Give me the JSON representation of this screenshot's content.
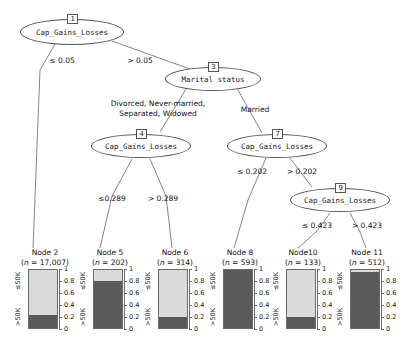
{
  "tree": {
    "title": "Conditional inference decision tree",
    "internal_nodes": [
      {
        "id": "1",
        "label": "Cap_Gains_Losses",
        "cx": 72,
        "cy": 32,
        "rx": 52,
        "ry": 13,
        "box_x": 67,
        "box_y": 14
      },
      {
        "id": "3",
        "label": "Marital status",
        "cx": 213,
        "cy": 79,
        "rx": 48,
        "ry": 12,
        "box_x": 208,
        "box_y": 62
      },
      {
        "id": "4",
        "label": "Cap_Gains_Losses",
        "cx": 141,
        "cy": 146,
        "rx": 50,
        "ry": 12,
        "box_x": 136,
        "box_y": 129
      },
      {
        "id": "7",
        "label": "Cap_Gains_Losses",
        "cx": 277,
        "cy": 146,
        "rx": 50,
        "ry": 12,
        "box_x": 272,
        "box_y": 129
      },
      {
        "id": "9",
        "label": "Cap_Gains_Losses",
        "cx": 340,
        "cy": 200,
        "rx": 50,
        "ry": 12,
        "box_x": 335,
        "box_y": 183
      }
    ],
    "edge_labels": [
      {
        "id": "e1-left",
        "text": "≤ 0.05",
        "x": 32,
        "y": 56,
        "w": 60
      },
      {
        "id": "e1-right",
        "text": "> 0.05",
        "x": 110,
        "y": 56,
        "w": 60
      },
      {
        "id": "e3-left-line1",
        "text": "Divorced, Never-married,",
        "x": 98,
        "y": 101,
        "w": 120
      },
      {
        "id": "e3-left-line2",
        "text": "Separated, Widowed",
        "x": 98,
        "y": 111,
        "w": 120
      },
      {
        "id": "e3-right",
        "text": "Married",
        "x": 228,
        "y": 104,
        "w": 60
      },
      {
        "id": "e4-left",
        "text": "≤0.289",
        "x": 90,
        "y": 194,
        "w": 46
      },
      {
        "id": "e4-right",
        "text": "> 0.289",
        "x": 138,
        "y": 194,
        "w": 50
      },
      {
        "id": "e7-left",
        "text": "≤ 0.202",
        "x": 229,
        "y": 167,
        "w": 50
      },
      {
        "id": "e7-right",
        "text": "> 0.202",
        "x": 278,
        "y": 167,
        "w": 50
      },
      {
        "id": "e9-left",
        "text": "≤ 0.423",
        "x": 293,
        "y": 221,
        "w": 50
      },
      {
        "id": "e9-right",
        "text": "> 0.423",
        "x": 342,
        "y": 221,
        "w": 50
      }
    ]
  },
  "leaves": [
    {
      "id": "node2",
      "title": "Node 2",
      "n_prefix": "n",
      "n_value": "17,007",
      "x": 14,
      "y": 248,
      "prop_high": 0.21,
      "prop_low": 0.79
    },
    {
      "id": "node5",
      "title": "Node 5",
      "n_prefix": "n",
      "n_value": "202",
      "x": 79,
      "y": 248,
      "prop_high": 0.79,
      "prop_low": 0.21
    },
    {
      "id": "node6",
      "title": "Node 6",
      "n_prefix": "n",
      "n_value": "314",
      "x": 144,
      "y": 248,
      "prop_high": 0.18,
      "prop_low": 0.82
    },
    {
      "id": "node8",
      "title": "Node 8",
      "n_prefix": "n",
      "n_value": "593",
      "x": 209,
      "y": 248,
      "prop_high": 1.0,
      "prop_low": 0.0
    },
    {
      "id": "node10",
      "title": "Node10",
      "n_prefix": "n",
      "n_value": "133",
      "x": 272,
      "y": 248,
      "prop_high": 0.19,
      "prop_low": 0.81
    },
    {
      "id": "node11",
      "title": "Node 11",
      "n_prefix": "n",
      "n_value": "512",
      "x": 336,
      "y": 248,
      "prop_high": 0.93,
      "prop_low": 0.07
    }
  ],
  "axis": {
    "ticks": [
      "1",
      "0.8",
      "0.6",
      "0.4",
      "0.2",
      "0"
    ],
    "tick_values": [
      1,
      0.8,
      0.6,
      0.4,
      0.2,
      0
    ],
    "ylim": [
      0,
      1
    ]
  },
  "class_labels": {
    "low": "≤50K",
    "high": ">50K"
  },
  "colors": {
    "segment_low": "#d9d9d9",
    "segment_high": "#5a5a5a",
    "stroke": "#6b6b6b",
    "text": "#111111",
    "background": "#ffffff"
  },
  "chart_data": {
    "type": "bar",
    "xlabel": "",
    "ylabel": "",
    "ylim": [
      0,
      1
    ],
    "grid": false,
    "legend_position": "none",
    "categories": [
      "Node 2",
      "Node 5",
      "Node 6",
      "Node 8",
      "Node10",
      "Node 11"
    ],
    "counts": [
      17007,
      202,
      314,
      593,
      133,
      512
    ],
    "series": [
      {
        "name": "≤50K",
        "values": [
          0.79,
          0.21,
          0.82,
          0.0,
          0.81,
          0.07
        ]
      },
      {
        "name": ">50K",
        "values": [
          0.21,
          0.79,
          0.18,
          1.0,
          0.19,
          0.93
        ]
      }
    ]
  }
}
